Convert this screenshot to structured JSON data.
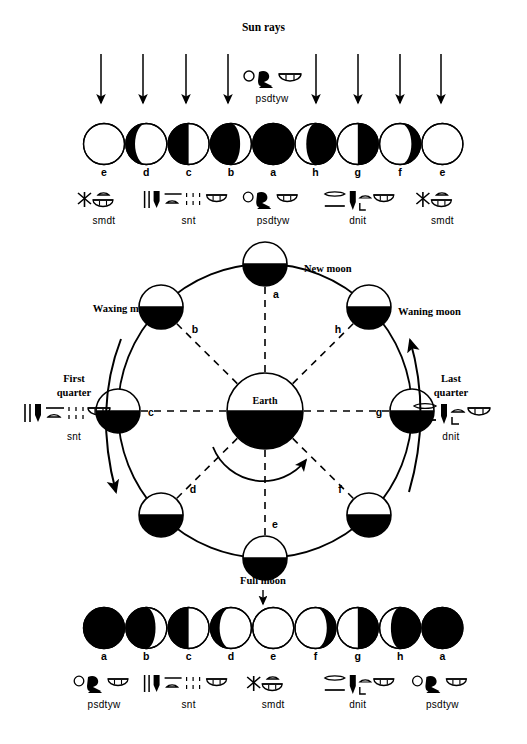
{
  "figure": {
    "title": "Sun rays",
    "center_label": "Earth",
    "new_moon_label": "New moon",
    "full_moon_label": "Full moon",
    "waxing_label": "Waxing moon",
    "waning_label": "Waning moon",
    "first_quarter_label": "First quarter",
    "last_quarter_label": "Last quarter",
    "ink_color": "#000000",
    "paper_color": "#ffffff"
  },
  "top_row": {
    "arrow_count": 8,
    "hieroglyph_over_arrows": "psdtyw",
    "phases": [
      {
        "letter": "e",
        "illum": "full-lit",
        "lit_side": "none"
      },
      {
        "letter": "d",
        "illum": "waning-gibbous",
        "lit_side": "right"
      },
      {
        "letter": "c",
        "illum": "half-left-dark",
        "lit_side": "right"
      },
      {
        "letter": "b",
        "illum": "crescent-right",
        "lit_side": "right"
      },
      {
        "letter": "a",
        "illum": "all-dark",
        "lit_side": "none"
      },
      {
        "letter": "h",
        "illum": "crescent-left",
        "lit_side": "left"
      },
      {
        "letter": "g",
        "illum": "half-right-dark",
        "lit_side": "left"
      },
      {
        "letter": "f",
        "illum": "gibbous-left",
        "lit_side": "left"
      },
      {
        "letter": "e",
        "illum": "full-lit",
        "lit_side": "none"
      }
    ],
    "glyph_labels": [
      {
        "text": "smdt",
        "index": 0
      },
      {
        "text": "snt",
        "index": 2
      },
      {
        "text": "psdtyw",
        "index": 4
      },
      {
        "text": "dnit",
        "index": 6
      },
      {
        "text": "smdt",
        "index": 8
      }
    ]
  },
  "orbit": {
    "positions": [
      {
        "letter": "a",
        "angle_deg": 90,
        "name": "New moon"
      },
      {
        "letter": "b",
        "angle_deg": 135,
        "name": ""
      },
      {
        "letter": "c",
        "angle_deg": 180,
        "name": "First quarter"
      },
      {
        "letter": "d",
        "angle_deg": 225,
        "name": ""
      },
      {
        "letter": "e",
        "angle_deg": 270,
        "name": "Full moon"
      },
      {
        "letter": "f",
        "angle_deg": 315,
        "name": ""
      },
      {
        "letter": "g",
        "angle_deg": 0,
        "name": "Last quarter"
      },
      {
        "letter": "h",
        "angle_deg": 45,
        "name": ""
      }
    ],
    "first_quarter_glyph": "snt",
    "last_quarter_glyph": "dnit"
  },
  "bottom_row": {
    "phases": [
      {
        "letter": "a",
        "illum": "all-dark"
      },
      {
        "letter": "b",
        "illum": "crescent-right-lit"
      },
      {
        "letter": "c",
        "illum": "half-right-lit"
      },
      {
        "letter": "d",
        "illum": "gibbous-right-lit"
      },
      {
        "letter": "e",
        "illum": "full-lit"
      },
      {
        "letter": "f",
        "illum": "gibbous-left-lit"
      },
      {
        "letter": "g",
        "illum": "half-left-lit"
      },
      {
        "letter": "h",
        "illum": "crescent-left-lit"
      },
      {
        "letter": "a",
        "illum": "all-dark"
      }
    ],
    "glyph_labels": [
      {
        "text": "psdtyw",
        "index": 0
      },
      {
        "text": "snt",
        "index": 2
      },
      {
        "text": "smdt",
        "index": 4
      },
      {
        "text": "dnit",
        "index": 6
      },
      {
        "text": "psdtyw",
        "index": 8
      }
    ]
  }
}
